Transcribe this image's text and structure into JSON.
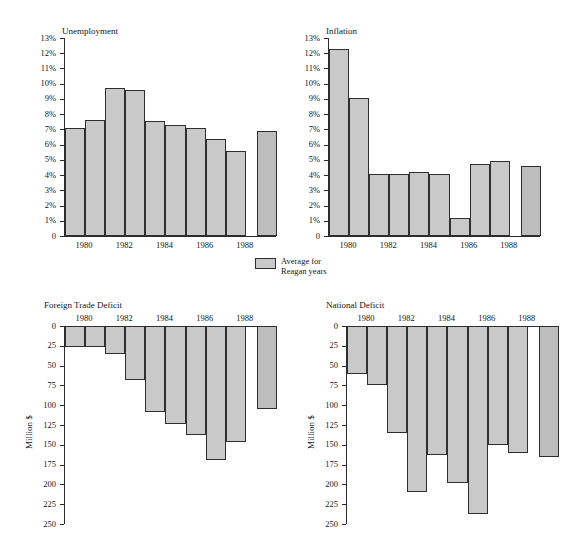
{
  "scan_artifact": "",
  "legend": {
    "swatch_name": "average-swatch",
    "label": "Average for\nReagan years",
    "color": "#c9c9c9"
  },
  "colors": {
    "bar_fill": "#c9c9c9",
    "bar_average_fill": "#bdbdbd",
    "bar_stroke": "#2f2f2f",
    "axis": "#2b2b2b",
    "text": "#161616",
    "background": "#ffffff"
  },
  "charts": [
    {
      "id": "unemployment",
      "title": "Unemployment",
      "type": "bar",
      "orientation": "up",
      "xlabel": "",
      "ylabel": "",
      "ylim": [
        0,
        13
      ],
      "ytick_step": 1,
      "ytick_labels": [
        "13%",
        "12%",
        "11%",
        "10%",
        "9%",
        "8%",
        "7%",
        "6%",
        "5%",
        "4%",
        "3%",
        "2%",
        "1%",
        "0"
      ],
      "ytick_values": [
        13,
        12,
        11,
        10,
        9,
        8,
        7,
        6,
        5,
        4,
        3,
        2,
        1,
        0
      ],
      "categories": [
        "1980",
        "1981",
        "1982",
        "1983",
        "1984",
        "1985",
        "1986",
        "1987",
        "1988",
        "Average"
      ],
      "xtick_labels": [
        "1980",
        "1982",
        "1984",
        "1986",
        "1988"
      ],
      "values": [
        7.1,
        7.6,
        9.7,
        9.6,
        7.55,
        7.3,
        7.1,
        6.35,
        5.6,
        6.9
      ],
      "average_index": 9,
      "grid": false
    },
    {
      "id": "inflation",
      "title": "Inflation",
      "type": "bar",
      "orientation": "up",
      "xlabel": "",
      "ylabel": "",
      "ylim": [
        0,
        13
      ],
      "ytick_step": 1,
      "ytick_labels": [
        "13%",
        "12%",
        "11%",
        "10%",
        "9%",
        "8%",
        "7%",
        "6%",
        "5%",
        "4%",
        "3%",
        "2%",
        "1%",
        "0"
      ],
      "ytick_values": [
        13,
        12,
        11,
        10,
        9,
        8,
        7,
        6,
        5,
        4,
        3,
        2,
        1,
        0
      ],
      "categories": [
        "1980",
        "1981",
        "1982",
        "1983",
        "1984",
        "1985",
        "1986",
        "1987",
        "1988",
        "Average"
      ],
      "xtick_labels": [
        "1980",
        "1982",
        "1984",
        "1986",
        "1988"
      ],
      "values": [
        12.3,
        9.05,
        4.05,
        4.05,
        4.2,
        4.1,
        1.15,
        4.75,
        4.95,
        4.6
      ],
      "average_index": 9,
      "grid": false
    },
    {
      "id": "foreign-trade-deficit",
      "title": "Foreign Trade Deficit",
      "type": "bar",
      "orientation": "down",
      "xlabel": "",
      "ylabel": "Million $",
      "ylim": [
        0,
        250
      ],
      "ytick_step": 25,
      "ytick_labels": [
        "0",
        "25",
        "50",
        "75",
        "100",
        "125",
        "150",
        "175",
        "200",
        "225",
        "250"
      ],
      "ytick_values": [
        0,
        25,
        50,
        75,
        100,
        125,
        150,
        175,
        200,
        225,
        250
      ],
      "categories": [
        "1980",
        "1981",
        "1982",
        "1983",
        "1984",
        "1985",
        "1986",
        "1987",
        "1988",
        "Average"
      ],
      "xtick_labels": [
        "1980",
        "1982",
        "1984",
        "1986",
        "1988"
      ],
      "values": [
        26,
        26,
        35,
        68,
        108,
        124,
        138,
        169,
        146,
        105
      ],
      "average_index": 9,
      "grid": false
    },
    {
      "id": "national-deficit",
      "title": "National Deficit",
      "type": "bar",
      "orientation": "down",
      "xlabel": "",
      "ylabel": "Million $",
      "ylim": [
        0,
        250
      ],
      "ytick_step": 25,
      "ytick_labels": [
        "0",
        "25",
        "50",
        "75",
        "100",
        "125",
        "150",
        "175",
        "200",
        "225",
        "250"
      ],
      "ytick_values": [
        0,
        25,
        50,
        75,
        100,
        125,
        150,
        175,
        200,
        225,
        250
      ],
      "categories": [
        "1980",
        "1981",
        "1982",
        "1983",
        "1984",
        "1985",
        "1986",
        "1987",
        "1988",
        "Average"
      ],
      "xtick_labels": [
        "1980",
        "1982",
        "1984",
        "1986",
        "1988"
      ],
      "values": [
        60,
        75,
        135,
        210,
        163,
        198,
        237,
        150,
        160,
        166
      ],
      "average_index": 9,
      "grid": false
    }
  ],
  "chart_data": [
    {
      "type": "bar",
      "title": "Unemployment",
      "xlabel": "",
      "ylabel": "",
      "ylim": [
        0,
        13
      ],
      "grid": false,
      "legend": "Average for Reagan years",
      "categories": [
        "1980",
        "1981",
        "1982",
        "1983",
        "1984",
        "1985",
        "1986",
        "1987",
        "1988",
        "Average for Reagan years"
      ],
      "values": [
        7.1,
        7.6,
        9.7,
        9.6,
        7.55,
        7.3,
        7.1,
        6.35,
        5.6,
        6.9
      ],
      "units": "percent"
    },
    {
      "type": "bar",
      "title": "Inflation",
      "xlabel": "",
      "ylabel": "",
      "ylim": [
        0,
        13
      ],
      "grid": false,
      "legend": "Average for Reagan years",
      "categories": [
        "1980",
        "1981",
        "1982",
        "1983",
        "1984",
        "1985",
        "1986",
        "1987",
        "1988",
        "Average for Reagan years"
      ],
      "values": [
        12.3,
        9.05,
        4.05,
        4.05,
        4.2,
        4.1,
        1.15,
        4.75,
        4.95,
        4.6
      ],
      "units": "percent"
    },
    {
      "type": "bar",
      "title": "Foreign Trade Deficit",
      "xlabel": "",
      "ylabel": "Million $",
      "ylim": [
        0,
        250
      ],
      "grid": false,
      "legend": "Average for Reagan years",
      "categories": [
        "1980",
        "1981",
        "1982",
        "1983",
        "1984",
        "1985",
        "1986",
        "1987",
        "1988",
        "Average for Reagan years"
      ],
      "values": [
        26,
        26,
        35,
        68,
        108,
        124,
        138,
        169,
        146,
        105
      ],
      "units": "Million $",
      "note": "axis inverted; bars descend from zero at top"
    },
    {
      "type": "bar",
      "title": "National Deficit",
      "xlabel": "",
      "ylabel": "Million $",
      "ylim": [
        0,
        250
      ],
      "grid": false,
      "legend": "Average for Reagan years",
      "categories": [
        "1980",
        "1981",
        "1982",
        "1983",
        "1984",
        "1985",
        "1986",
        "1987",
        "1988",
        "Average for Reagan years"
      ],
      "values": [
        60,
        75,
        135,
        210,
        163,
        198,
        237,
        150,
        160,
        166
      ],
      "units": "Million $",
      "note": "axis inverted; bars descend from zero at top"
    }
  ]
}
